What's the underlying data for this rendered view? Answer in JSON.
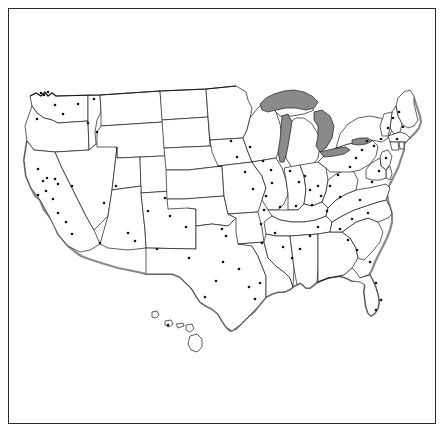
{
  "figure": {
    "name": "united-states-map",
    "background_color": "#ffffff",
    "frame_color": "#2b2b2b",
    "frame_width_px": 1
  },
  "style": {
    "state_fill": "#ffffff",
    "state_border_color": "#1a1a1a",
    "nation_border_color": "#1a1a1a",
    "lake_fill": "#8a8a8a",
    "coast_shadow_color": "#8a8a8a",
    "city_dot_color": "#111111",
    "city_dot_radius_px": 1.3
  },
  "canvas": {
    "width": 445,
    "height": 433,
    "map_left": 20,
    "map_top": 82,
    "map_right": 425,
    "map_bottom": 360
  },
  "legend": {
    "lake_label": "Great Lakes",
    "dot_label": "City"
  },
  "chart_data": {
    "type": "map",
    "title": "",
    "regions_shaded": [
      "Lake Superior",
      "Lake Michigan",
      "Lake Huron",
      "Lake Erie",
      "Lake Ontario"
    ],
    "insets": [
      "Hawaii"
    ],
    "marker_count": 96,
    "markers": [
      [
        41,
        93
      ],
      [
        44,
        95
      ],
      [
        48,
        92
      ],
      [
        55,
        105
      ],
      [
        37,
        119
      ],
      [
        63,
        114
      ],
      [
        38,
        169
      ],
      [
        43,
        181
      ],
      [
        47,
        178
      ],
      [
        55,
        179
      ],
      [
        46,
        191
      ],
      [
        38,
        195
      ],
      [
        53,
        199
      ],
      [
        58,
        213
      ],
      [
        66,
        222
      ],
      [
        72,
        234
      ],
      [
        78,
        104
      ],
      [
        94,
        99
      ],
      [
        88,
        123
      ],
      [
        97,
        132
      ],
      [
        58,
        184
      ],
      [
        72,
        186
      ],
      [
        116,
        186
      ],
      [
        104,
        203
      ],
      [
        100,
        243
      ],
      [
        165,
        198
      ],
      [
        148,
        211
      ],
      [
        128,
        233
      ],
      [
        135,
        241
      ],
      [
        157,
        249
      ],
      [
        170,
        216
      ],
      [
        186,
        227
      ],
      [
        222,
        229
      ],
      [
        226,
        236
      ],
      [
        189,
        258
      ],
      [
        223,
        262
      ],
      [
        239,
        269
      ],
      [
        216,
        281
      ],
      [
        249,
        287
      ],
      [
        260,
        283
      ],
      [
        255,
        299
      ],
      [
        205,
        297
      ],
      [
        237,
        157
      ],
      [
        250,
        147
      ],
      [
        263,
        161
      ],
      [
        271,
        170
      ],
      [
        231,
        141
      ],
      [
        245,
        172
      ],
      [
        253,
        189
      ],
      [
        272,
        183
      ],
      [
        266,
        196
      ],
      [
        264,
        210
      ],
      [
        280,
        207
      ],
      [
        261,
        224
      ],
      [
        275,
        233
      ],
      [
        262,
        243
      ],
      [
        283,
        247
      ],
      [
        292,
        258
      ],
      [
        300,
        249
      ],
      [
        310,
        236
      ],
      [
        318,
        227
      ],
      [
        290,
        171
      ],
      [
        299,
        182
      ],
      [
        305,
        176
      ],
      [
        310,
        190
      ],
      [
        318,
        186
      ],
      [
        296,
        206
      ],
      [
        312,
        205
      ],
      [
        321,
        196
      ],
      [
        327,
        211
      ],
      [
        330,
        186
      ],
      [
        338,
        175
      ],
      [
        340,
        197
      ],
      [
        350,
        167
      ],
      [
        356,
        158
      ],
      [
        362,
        150
      ],
      [
        367,
        141
      ],
      [
        374,
        146
      ],
      [
        381,
        139
      ],
      [
        388,
        128
      ],
      [
        393,
        118
      ],
      [
        399,
        112
      ],
      [
        403,
        127
      ],
      [
        397,
        139
      ],
      [
        386,
        158
      ],
      [
        379,
        171
      ],
      [
        372,
        182
      ],
      [
        360,
        200
      ],
      [
        368,
        213
      ],
      [
        352,
        219
      ],
      [
        340,
        229
      ],
      [
        348,
        240
      ],
      [
        357,
        250
      ],
      [
        370,
        262
      ],
      [
        376,
        283
      ],
      [
        381,
        300
      ],
      [
        376,
        310
      ],
      [
        168,
        325
      ]
    ]
  }
}
